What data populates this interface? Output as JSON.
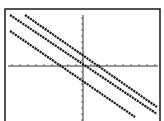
{
  "screen": {
    "title": "",
    "background": "#ffffff",
    "ink": "#1a1a1a"
  },
  "chart_data": {
    "type": "line",
    "title": "",
    "xlabel": "",
    "ylabel": "",
    "grid": false,
    "legend": null,
    "axes_visible": true,
    "tick_marks": true,
    "tick_labels": [],
    "xlim": [
      -10,
      10
    ],
    "ylim": [
      -7,
      7
    ],
    "series": [
      {
        "name": "line-upper",
        "slope": -0.67,
        "intercept": 1.3,
        "style": "dotted-thick"
      },
      {
        "name": "line-middle",
        "slope": -0.67,
        "intercept": 0,
        "style": "dotted-thick"
      },
      {
        "name": "line-lower",
        "slope": -0.67,
        "intercept": -2.0,
        "style": "dotted-thick"
      }
    ]
  },
  "pixels": {
    "frame": {
      "x": 5,
      "y": 9,
      "w": 155,
      "h": 115
    },
    "origin": {
      "x": 83,
      "y": 66
    },
    "x_axis": {
      "x1": 8,
      "x2": 158,
      "y": 66
    },
    "y_axis": {
      "x": 83,
      "y1": 15,
      "y2": 121
    },
    "x_ticks": [
      12,
      20,
      28,
      36,
      44,
      52,
      60,
      68,
      76,
      91,
      99,
      107,
      115,
      123,
      131,
      139,
      147,
      155
    ],
    "y_ticks": [
      18,
      24,
      30,
      36,
      42,
      48,
      54,
      60,
      72,
      78,
      84,
      90,
      96,
      102,
      108,
      114,
      120
    ],
    "lines": [
      {
        "x1": 25,
        "y1": 15,
        "x2": 157,
        "y2": 107
      },
      {
        "x1": 10,
        "y1": 15,
        "x2": 157,
        "y2": 114
      },
      {
        "x1": 10,
        "y1": 31,
        "x2": 135,
        "y2": 117
      }
    ]
  }
}
